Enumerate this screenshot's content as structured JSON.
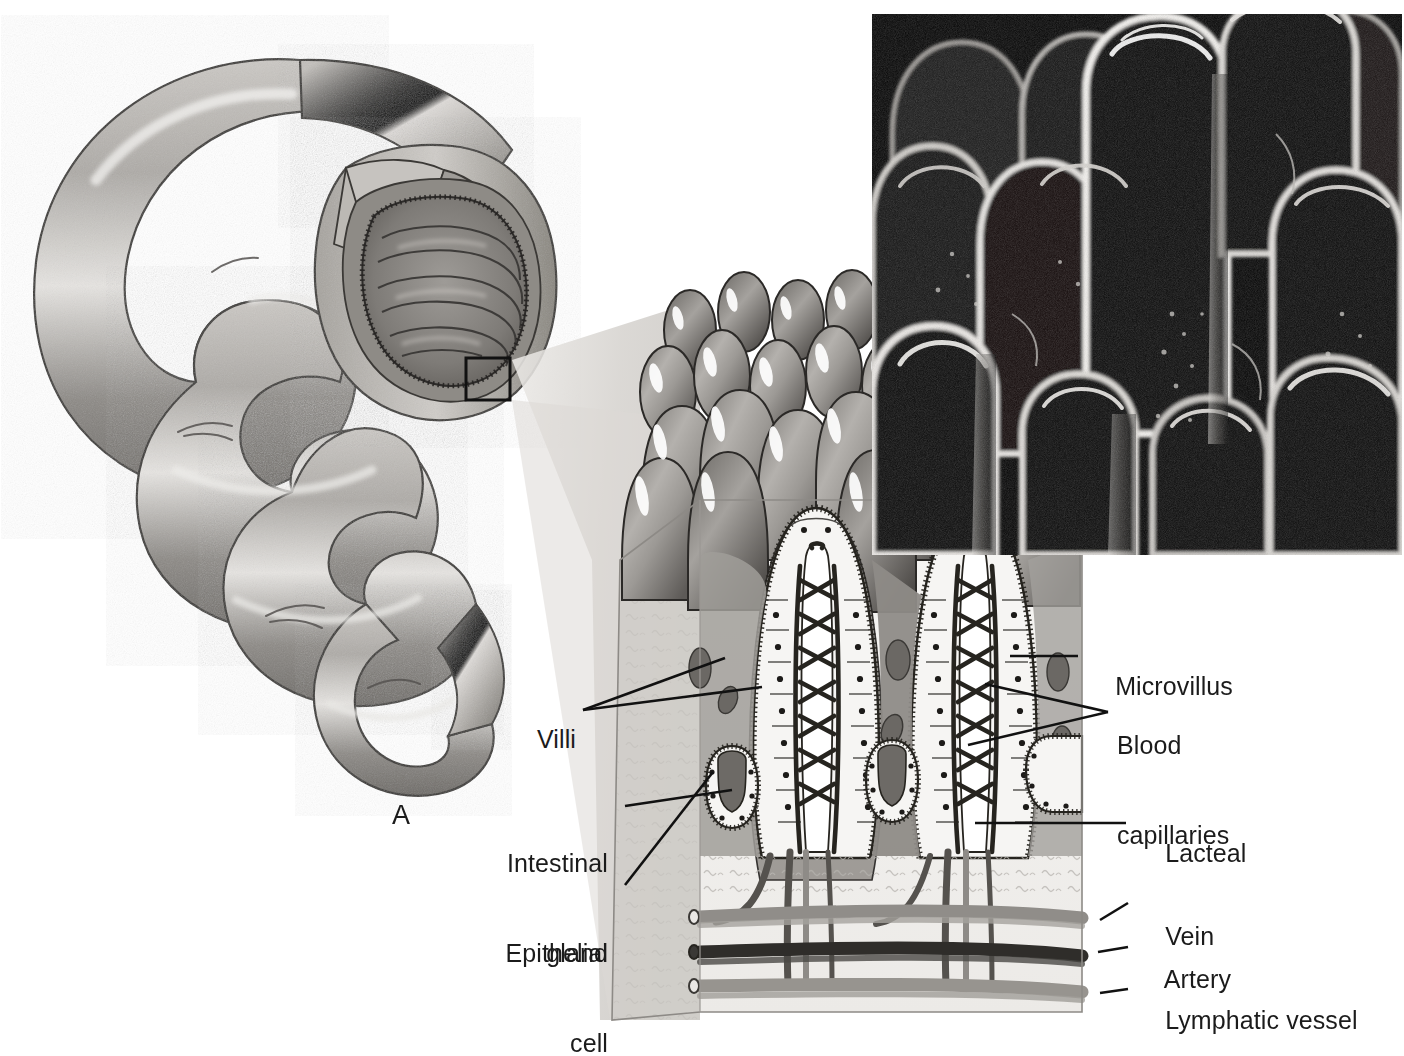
{
  "figure": {
    "panel_letter": "A",
    "background_color": "#ffffff",
    "text_color": "#1b1b1b"
  },
  "labels_left": [
    {
      "id": "villi",
      "text": "Villi",
      "lines": [
        "Villi"
      ],
      "x": 583,
      "y": 710,
      "align": "right"
    },
    {
      "id": "intestinal-gland",
      "text": "Intestinal gland",
      "lines": [
        "Intestinal",
        "gland"
      ],
      "x": 615,
      "y": 805,
      "align": "right"
    },
    {
      "id": "epithelial-cell",
      "text": "Epithelial cell",
      "lines": [
        "Epithelial",
        "cell"
      ],
      "x": 615,
      "y": 895,
      "align": "right"
    }
  ],
  "labels_right": [
    {
      "id": "microvillus",
      "text": "Microvillus",
      "lines": [
        "Microvillus"
      ],
      "x": 1087,
      "y": 657,
      "align": "left"
    },
    {
      "id": "blood-capillaries",
      "text": "Blood capillaries",
      "lines": [
        "Blood",
        "capillaries"
      ],
      "x": 1117,
      "y": 685,
      "align": "left"
    },
    {
      "id": "lacteal",
      "text": "Lacteal",
      "lines": [
        "Lacteal"
      ],
      "x": 1137,
      "y": 823,
      "align": "left"
    },
    {
      "id": "vein",
      "text": "Vein",
      "lines": [
        "Vein"
      ],
      "x": 1137,
      "y": 906,
      "align": "left"
    },
    {
      "id": "artery",
      "text": "Artery",
      "lines": [
        "Artery"
      ],
      "x": 1137,
      "y": 949,
      "align": "left"
    },
    {
      "id": "lymphatic-vessel",
      "text": "Lymphatic vessel",
      "lines": [
        "Lymphatic vessel"
      ],
      "x": 1137,
      "y": 990,
      "align": "left"
    }
  ],
  "colors": {
    "ink": "#1b1b1b",
    "leader_line": "#111111",
    "tissue_light": "#f2f1ee",
    "tissue_mid": "#b9b6b1",
    "tissue_dark": "#6f6c68",
    "villus_body": "#9b9894",
    "villus_shadow": "#55524f",
    "highlight": "#ffffff",
    "capillary": "#2b2a29",
    "vein": "#8e8b87",
    "artery": "#35332f",
    "lymphatic": "#9a9794",
    "wedge": "#d8d6d2",
    "micrograph_bg": "#060606",
    "micrograph_rim": "#f0efec"
  },
  "regions": {
    "intestine_drawing": {
      "name": "coiled small intestine with cut-away segment",
      "x": 10,
      "y": 20,
      "w": 560,
      "h": 830
    },
    "callout_box": {
      "name": "magnification callout rectangle",
      "x": 466,
      "y": 358,
      "w": 44,
      "h": 42
    },
    "magnifier_wedge": {
      "name": "fan from callout to villi block",
      "x": 510,
      "y": 300,
      "w": 190,
      "h": 720
    },
    "villi_block": {
      "name": "3D block of intestinal wall with villi",
      "x": 600,
      "y": 295,
      "w": 490,
      "h": 725
    },
    "micrograph": {
      "name": "scanning electron micrograph of villi",
      "x": 872,
      "y": 14,
      "w": 530,
      "h": 541
    }
  },
  "micrograph": {
    "kind": "scanning-electron-micrograph",
    "subject": "intestinal villi",
    "appearance": "finger-like projections, bright rim lighting on black background"
  },
  "villi_block_parts": [
    {
      "id": "surface-villi",
      "label": "rounded villi covering the luminal surface"
    },
    {
      "id": "sectioned-villi",
      "label": "two villi shown in longitudinal section"
    },
    {
      "id": "brush-border",
      "label": "microvilli fringe on epithelial cells"
    },
    {
      "id": "capillary-net",
      "label": "capillary network inside villus core"
    },
    {
      "id": "lacteal",
      "label": "central lymphatic capillary"
    },
    {
      "id": "gland-pits",
      "label": "intestinal glands (crypts of Lieberkuhn)"
    },
    {
      "id": "submucosa",
      "label": "connective tissue with scattered fibers"
    },
    {
      "id": "vessel-layer",
      "label": "vein, artery and lymphatic vessel at base"
    }
  ]
}
